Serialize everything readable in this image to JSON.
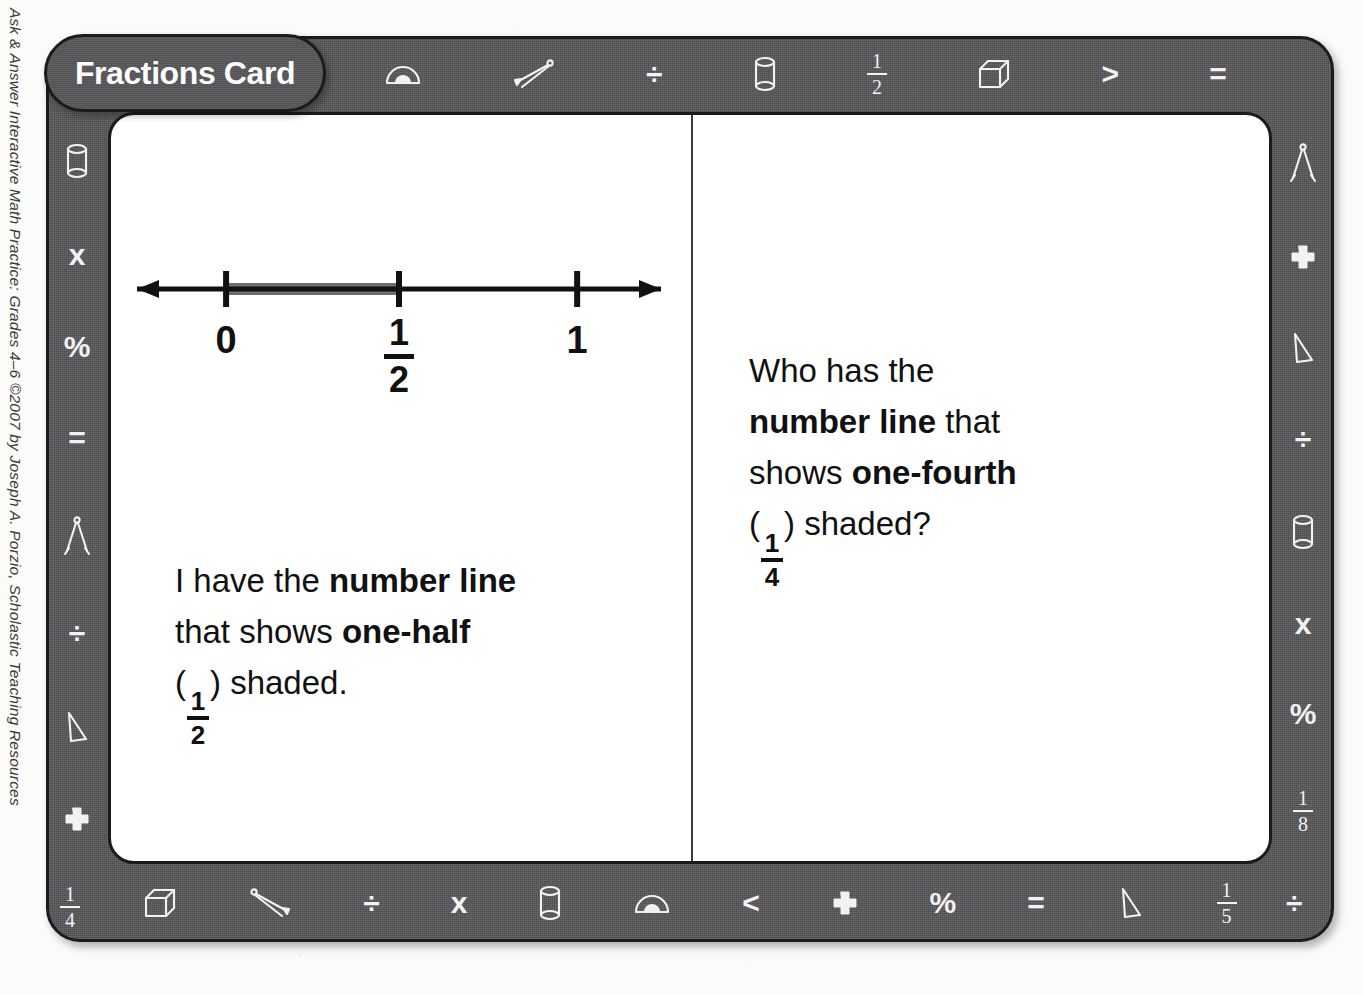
{
  "credit": {
    "text": "Ask & Answer Interactive Math Practice: Grades 4–6 ©2007 by Joseph A. Porzio, Scholastic Teaching Resources"
  },
  "card": {
    "title": "Fractions Card",
    "colors": {
      "frame_gray": "#56565a",
      "frame_outline": "#1b1b1d",
      "card_white": "#ffffff",
      "icon_white": "#f2f2f2",
      "shaded_segment_gray": "#6e6e6e",
      "text_black": "#111111"
    }
  },
  "border_icons": {
    "top": [
      {
        "name": "fraction-one-third-icon",
        "kind": "fraction",
        "num": "1",
        "den": "3"
      },
      {
        "name": "set-square-triangle-icon",
        "kind": "triangle"
      },
      {
        "name": "protractor-icon",
        "kind": "protractor"
      },
      {
        "name": "compass-icon",
        "kind": "compass-flat"
      },
      {
        "name": "division-sign-icon",
        "kind": "glyph",
        "glyph": "÷"
      },
      {
        "name": "cylinder-icon",
        "kind": "cylinder"
      },
      {
        "name": "fraction-one-half-icon",
        "kind": "fraction",
        "num": "1",
        "den": "2"
      },
      {
        "name": "cube-icon",
        "kind": "cube"
      },
      {
        "name": "greater-than-icon",
        "kind": "glyph",
        "glyph": "&gt;"
      },
      {
        "name": "equals-sign-icon",
        "kind": "glyph",
        "glyph": "="
      }
    ],
    "left": [
      {
        "name": "cylinder-icon",
        "kind": "cylinder"
      },
      {
        "name": "multiplication-sign-icon",
        "kind": "glyph",
        "glyph": "x"
      },
      {
        "name": "percent-sign-icon",
        "kind": "glyph",
        "glyph": "%"
      },
      {
        "name": "equals-sign-icon",
        "kind": "glyph",
        "glyph": "="
      },
      {
        "name": "compass-icon",
        "kind": "compass-open"
      },
      {
        "name": "division-sign-icon",
        "kind": "glyph",
        "glyph": "÷"
      },
      {
        "name": "set-square-triangle-icon",
        "kind": "triangle"
      },
      {
        "name": "plus-sign-icon",
        "kind": "plus"
      }
    ],
    "right": [
      {
        "name": "compass-icon",
        "kind": "compass-open"
      },
      {
        "name": "plus-sign-icon",
        "kind": "plus"
      },
      {
        "name": "set-square-triangle-icon",
        "kind": "triangle"
      },
      {
        "name": "division-sign-icon",
        "kind": "glyph",
        "glyph": "÷"
      },
      {
        "name": "cylinder-icon",
        "kind": "cylinder"
      },
      {
        "name": "multiplication-sign-icon",
        "kind": "glyph",
        "glyph": "x"
      },
      {
        "name": "percent-sign-icon",
        "kind": "glyph",
        "glyph": "%"
      },
      {
        "name": "fraction-one-eighth-icon",
        "kind": "fraction",
        "num": "1",
        "den": "8"
      }
    ],
    "bottom": [
      {
        "name": "cube-icon",
        "kind": "cube"
      },
      {
        "name": "compass-icon",
        "kind": "compass-flat-rev"
      },
      {
        "name": "division-sign-icon",
        "kind": "glyph",
        "glyph": "÷"
      },
      {
        "name": "multiplication-sign-icon",
        "kind": "glyph",
        "glyph": "x"
      },
      {
        "name": "cylinder-icon",
        "kind": "cylinder"
      },
      {
        "name": "protractor-icon",
        "kind": "protractor"
      },
      {
        "name": "less-than-icon",
        "kind": "glyph",
        "glyph": "&lt;"
      },
      {
        "name": "plus-sign-icon",
        "kind": "plus"
      },
      {
        "name": "percent-sign-icon",
        "kind": "glyph",
        "glyph": "%"
      },
      {
        "name": "equals-sign-icon",
        "kind": "glyph",
        "glyph": "="
      },
      {
        "name": "set-square-triangle-icon",
        "kind": "triangle"
      },
      {
        "name": "fraction-one-fifth-icon",
        "kind": "fraction",
        "num": "1",
        "den": "5"
      }
    ],
    "corners": {
      "bottom_left": {
        "name": "fraction-one-fourth-icon",
        "num": "1",
        "den": "4"
      },
      "bottom_right": {
        "name": "division-sign-icon",
        "glyph": "÷"
      }
    }
  },
  "number_line": {
    "ticks": [
      {
        "label_kind": "text",
        "label": "0",
        "pos_pct": 17
      },
      {
        "label_kind": "fraction",
        "num": "1",
        "den": "2",
        "pos_pct": 50
      },
      {
        "label_kind": "text",
        "label": "1",
        "pos_pct": 84
      }
    ],
    "shaded_from_pct": 17,
    "shaded_to_pct": 50,
    "arrow_left": true,
    "arrow_right": true
  },
  "answer": {
    "line1_pre": "I have the ",
    "line1_bold": "number line",
    "line2_pre": "that shows ",
    "line2_bold": "one-half",
    "line3_open": "(",
    "line3_num": "1",
    "line3_den": "2",
    "line3_close": ") shaded."
  },
  "question": {
    "line1": "Who has the",
    "line2_bold": "number line",
    "line2_post": " that",
    "line3_pre": "shows ",
    "line3_bold": "one-fourth",
    "line4_open": "(",
    "line4_num": "1",
    "line4_den": "4",
    "line4_close": ") shaded?"
  }
}
